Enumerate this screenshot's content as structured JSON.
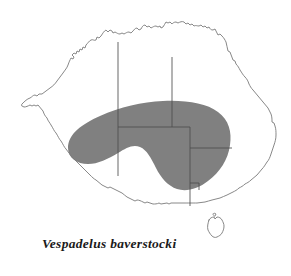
{
  "figure": {
    "type": "species-distribution-map",
    "region": "Australia",
    "caption": "Vespadelus baverstocki",
    "background_color": "#ffffff",
    "coastline_color": "#7a7a7a",
    "border_color": "#4d4d4d",
    "range_fill_color": "#808080",
    "caption_color": "#1a1a1a"
  },
  "legend": {
    "range_description": "Shaded area indicates species distribution range"
  },
  "map": {
    "landmasses": [
      {
        "name": "mainland-australia"
      },
      {
        "name": "tasmania"
      }
    ],
    "state_borders": [
      {
        "name": "wa-nt-sa-border-vertical"
      },
      {
        "name": "nt-qld-border-vertical"
      },
      {
        "name": "nt-sa-border-horizontal"
      },
      {
        "name": "sa-nsw-border-horizontal"
      },
      {
        "name": "sa-vic-nsw-border-vertical"
      }
    ],
    "range_polygon": {
      "name": "distribution-range-shading"
    }
  }
}
